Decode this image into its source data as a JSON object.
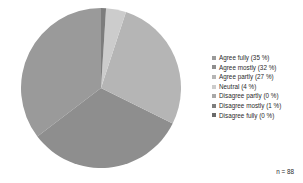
{
  "chart_data": {
    "type": "pie",
    "title": "",
    "subtitle": "",
    "xlabel": "",
    "ylabel": "",
    "legend_position": "right",
    "grid": false,
    "annotations": [
      "n = 88"
    ],
    "sample_size_label": "n = 88",
    "categories": [
      "Agree fully",
      "Agree mostly",
      "Agree partly",
      "Neutral",
      "Disagree partly",
      "Disagree mostly",
      "Disagree fully"
    ],
    "values": [
      35,
      32,
      27,
      4,
      0,
      1,
      0
    ],
    "unit": "%",
    "colors": [
      "#9a9a9a",
      "#8e8e8e",
      "#b5b5b5",
      "#cccccc",
      "#a8a8a8",
      "#7d7d7d",
      "#6a6a6a"
    ],
    "slices": [
      {
        "label": "Agree fully",
        "value": 35,
        "legend_text": "Agree fully (35 %)",
        "color": "#9a9a9a"
      },
      {
        "label": "Agree mostly",
        "value": 32,
        "legend_text": "Agree mostly (32 %)",
        "color": "#8e8e8e"
      },
      {
        "label": "Agree partly",
        "value": 27,
        "legend_text": "Agree partly (27 %)",
        "color": "#b5b5b5"
      },
      {
        "label": "Neutral",
        "value": 4,
        "legend_text": "Neutral (4 %)",
        "color": "#cccccc"
      },
      {
        "label": "Disagree partly",
        "value": 0,
        "legend_text": "Disagree partly (0 %)",
        "color": "#a8a8a8"
      },
      {
        "label": "Disagree mostly",
        "value": 1,
        "legend_text": "Disagree mostly (1 %)",
        "color": "#7d7d7d"
      },
      {
        "label": "Disagree fully",
        "value": 0,
        "legend_text": "Disagree fully (0 %)",
        "color": "#6a6a6a"
      }
    ],
    "geometry": {
      "center_x": 80,
      "center_y": 80,
      "radius": 80,
      "start_angle_deg": 0,
      "direction": "counterclockwise"
    }
  }
}
